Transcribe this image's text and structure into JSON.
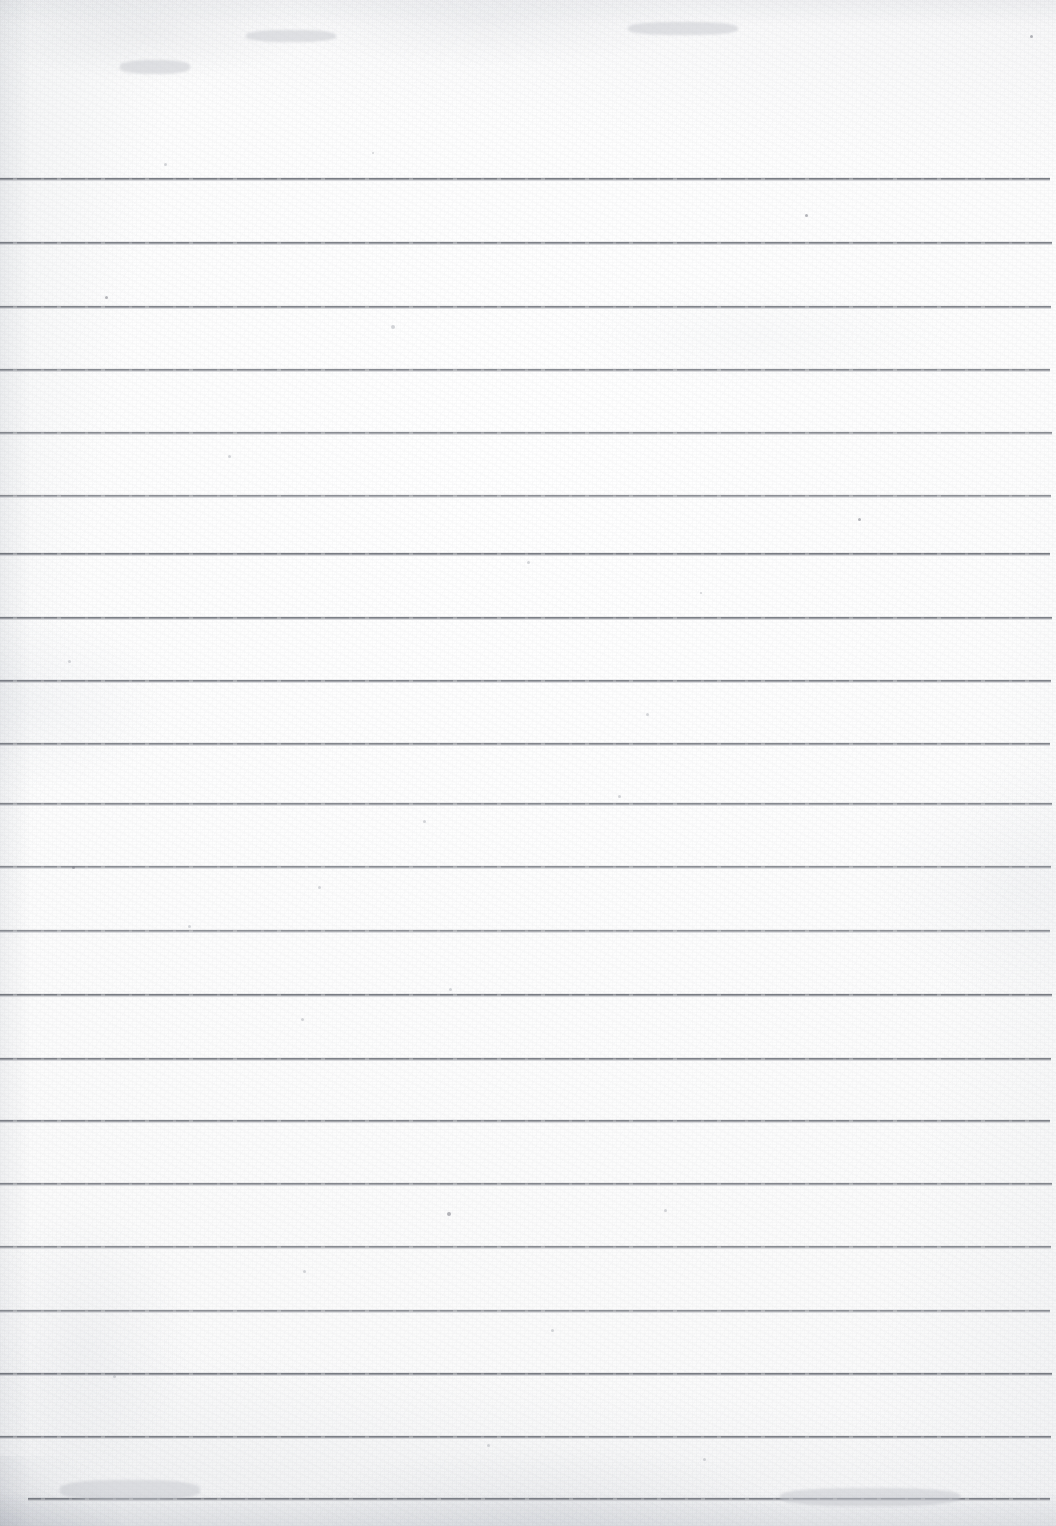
{
  "document": {
    "type": "scanned-document",
    "title": "Blank ruled notebook page",
    "description": "A scan of an empty sheet of lined/ruled writing paper. No handwriting, no printed text, no headers, no page number, no margin rule.",
    "orientation": "portrait",
    "width_px": 1056,
    "height_px": 1526,
    "text_content": "",
    "has_visible_text": false
  },
  "paper": {
    "background_color": "#fdfdfd",
    "tint_color": "#f6f7f8",
    "edge_shadow_color": "#e9eaed",
    "texture": "fine scanner grain with faint blotches"
  },
  "ruling": {
    "line_color": "#70747c",
    "line_thickness_px": 2,
    "line_spacing_px": 63.5,
    "line_count": 21,
    "first_line_y": 178,
    "default_left_x": 0,
    "default_right_x": 1050,
    "lines": [
      {
        "index": 1,
        "y": 178,
        "left": 0,
        "right": 1050
      },
      {
        "index": 2,
        "y": 242,
        "left": 0,
        "right": 1052
      },
      {
        "index": 3,
        "y": 306,
        "left": 0,
        "right": 1051
      },
      {
        "index": 4,
        "y": 369,
        "left": 0,
        "right": 1050
      },
      {
        "index": 5,
        "y": 432,
        "left": 0,
        "right": 1052
      },
      {
        "index": 6,
        "y": 495,
        "left": 0,
        "right": 1051
      },
      {
        "index": 7,
        "y": 553,
        "left": 0,
        "right": 1050
      },
      {
        "index": 8,
        "y": 617,
        "left": 0,
        "right": 1052
      },
      {
        "index": 9,
        "y": 680,
        "left": 0,
        "right": 1051
      },
      {
        "index": 10,
        "y": 743,
        "left": 0,
        "right": 1050
      },
      {
        "index": 11,
        "y": 803,
        "left": 0,
        "right": 1052
      },
      {
        "index": 12,
        "y": 866,
        "left": 0,
        "right": 1051
      },
      {
        "index": 13,
        "y": 930,
        "left": 0,
        "right": 1050
      },
      {
        "index": 14,
        "y": 994,
        "left": 0,
        "right": 1052
      },
      {
        "index": 15,
        "y": 1058,
        "left": 0,
        "right": 1051
      },
      {
        "index": 16,
        "y": 1120,
        "left": 0,
        "right": 1050
      },
      {
        "index": 17,
        "y": 1183,
        "left": 0,
        "right": 1052
      },
      {
        "index": 18,
        "y": 1246,
        "left": 0,
        "right": 1051
      },
      {
        "index": 19,
        "y": 1310,
        "left": 0,
        "right": 1050
      },
      {
        "index": 20,
        "y": 1373,
        "left": 0,
        "right": 1052
      },
      {
        "index": 21,
        "y": 1436,
        "left": 0,
        "right": 1051
      },
      {
        "index": 22,
        "y": 1498,
        "left": 28,
        "right": 1050
      }
    ]
  },
  "artifacts": {
    "specks": [
      {
        "x": 1030,
        "y": 35,
        "size": 3,
        "kind": "speck"
      },
      {
        "x": 805,
        "y": 214,
        "size": 3,
        "kind": "speck"
      },
      {
        "x": 164,
        "y": 163,
        "size": 3,
        "kind": "faint"
      },
      {
        "x": 372,
        "y": 152,
        "size": 2,
        "kind": "faint"
      },
      {
        "x": 105,
        "y": 296,
        "size": 3,
        "kind": "speck"
      },
      {
        "x": 391,
        "y": 325,
        "size": 4,
        "kind": "faint"
      },
      {
        "x": 228,
        "y": 455,
        "size": 3,
        "kind": "faint"
      },
      {
        "x": 858,
        "y": 518,
        "size": 3,
        "kind": "speck"
      },
      {
        "x": 527,
        "y": 561,
        "size": 3,
        "kind": "faint"
      },
      {
        "x": 700,
        "y": 592,
        "size": 2,
        "kind": "faint"
      },
      {
        "x": 68,
        "y": 660,
        "size": 3,
        "kind": "faint"
      },
      {
        "x": 646,
        "y": 713,
        "size": 3,
        "kind": "faint"
      },
      {
        "x": 618,
        "y": 795,
        "size": 3,
        "kind": "faint"
      },
      {
        "x": 423,
        "y": 820,
        "size": 3,
        "kind": "faint"
      },
      {
        "x": 72,
        "y": 866,
        "size": 3,
        "kind": "speck"
      },
      {
        "x": 318,
        "y": 886,
        "size": 3,
        "kind": "faint"
      },
      {
        "x": 188,
        "y": 925,
        "size": 3,
        "kind": "faint"
      },
      {
        "x": 449,
        "y": 988,
        "size": 3,
        "kind": "faint"
      },
      {
        "x": 301,
        "y": 1018,
        "size": 3,
        "kind": "faint"
      },
      {
        "x": 664,
        "y": 1209,
        "size": 3,
        "kind": "faint"
      },
      {
        "x": 447,
        "y": 1212,
        "size": 4,
        "kind": "speck"
      },
      {
        "x": 303,
        "y": 1270,
        "size": 3,
        "kind": "faint"
      },
      {
        "x": 551,
        "y": 1329,
        "size": 3,
        "kind": "faint"
      },
      {
        "x": 113,
        "y": 1375,
        "size": 3,
        "kind": "faint"
      },
      {
        "x": 703,
        "y": 1458,
        "size": 3,
        "kind": "faint"
      },
      {
        "x": 487,
        "y": 1444,
        "size": 3,
        "kind": "faint"
      }
    ],
    "smudges": [
      {
        "x": 120,
        "y": 60,
        "w": 70,
        "h": 14
      },
      {
        "x": 246,
        "y": 30,
        "w": 90,
        "h": 12
      },
      {
        "x": 628,
        "y": 22,
        "w": 110,
        "h": 13
      },
      {
        "x": 60,
        "y": 1480,
        "w": 140,
        "h": 20
      },
      {
        "x": 780,
        "y": 1488,
        "w": 180,
        "h": 18
      }
    ]
  }
}
